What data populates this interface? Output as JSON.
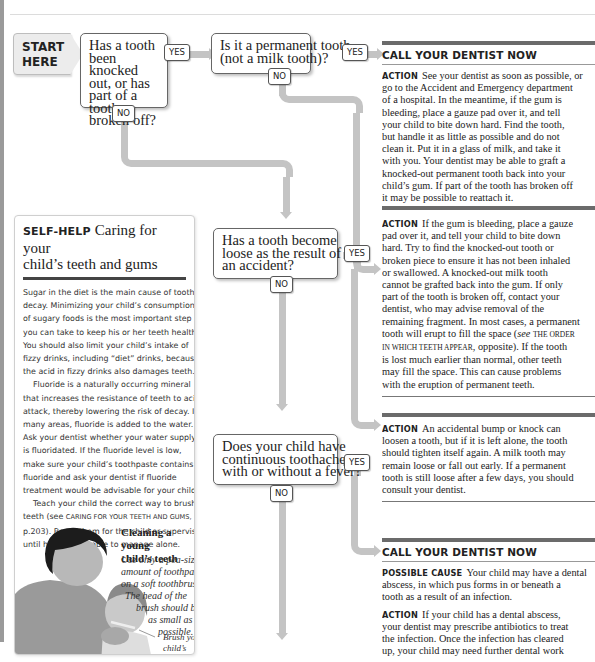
{
  "flowchart": {
    "start": {
      "line1": "START",
      "line2": "HERE"
    },
    "q1": {
      "lines": [
        "Has a tooth",
        "been knocked",
        "out, or has",
        "part of a tooth",
        "broken off?"
      ],
      "yes": "YES",
      "no": "NO"
    },
    "q2": {
      "lines": [
        "Is it a permanent tooth",
        "(not a milk tooth)?"
      ],
      "yes": "YES",
      "no": "NO"
    },
    "q3": {
      "lines": [
        "Has a tooth become",
        "loose as the result of",
        "an accident?"
      ],
      "yes": "YES",
      "no": "NO"
    },
    "q4": {
      "lines": [
        "Does your child have",
        "continuous toothache",
        "with or without a fever?"
      ],
      "yes": "YES",
      "no": "NO"
    }
  },
  "actions": {
    "a1": {
      "heading": "CALL YOUR DENTIST NOW",
      "label": "Action",
      "lines": [
        "See your dentist as soon as possible, or",
        "go to the Accident and Emergency department",
        "of a hospital. In the meantime, if the gum is",
        "bleeding, place a gauze pad over it, and tell",
        "your child to bite down hard. Find the tooth,",
        "but handle it as little as possible and do not",
        "clean it. Put it in a glass of milk, and take it",
        "with you. Your dentist may be able to graft a",
        "knocked-out permanent tooth back into your",
        "child’s gum. If part of the tooth has broken off",
        "it may be possible to reattach it."
      ]
    },
    "a2": {
      "label": "Action",
      "lines": [
        "If the gum is bleeding, place a gauze",
        "pad over it, and tell your child to bite down",
        "hard. Try to find the knocked-out tooth or",
        "broken piece to ensure it has not been inhaled",
        "or swallowed. A knocked-out milk tooth",
        "cannot be grafted back into the gum. If only",
        "part of the tooth is broken off, contact your",
        "dentist, who may advise removal of the",
        "remaining fragment. In most cases, a permanent",
        "tooth will erupt to fill the space (",
        "is lost much earlier than normal, other teeth",
        "may fill the space. This can cause problems",
        "with the eruption of permanent teeth."
      ],
      "see": "see",
      "ref_part1": "THE ORDER",
      "ref_part2": "IN WHICH TEETH APPEAR",
      "after_ref": ", opposite). If the tooth"
    },
    "a3": {
      "label": "Action",
      "lines": [
        "An accidental bump or knock can",
        "loosen a tooth, but if it is left alone, the tooth",
        "should tighten itself again. A milk tooth may",
        "remain loose or fall out early. If a permanent",
        "tooth is still loose after a few days, you should",
        "consult your dentist."
      ]
    },
    "a4": {
      "heading": "CALL YOUR DENTIST NOW",
      "cause_label": "Possible cause",
      "cause_lines": [
        "Your child may have a dental",
        "abscess, in which pus forms in or beneath a",
        "tooth as a result of an infection."
      ],
      "label": "Action",
      "lines": [
        "If your child has a dental abscess,",
        "your dentist may prescribe antibiotics to treat",
        "the infection. Once the infection has cleared",
        "up, your child may need further dental work"
      ]
    }
  },
  "selfhelp": {
    "label": "SELF-HELP",
    "title_line1": "Caring for your",
    "title_line2": "child’s teeth and gums",
    "body_lines": [
      "Sugar in the diet is the main cause of tooth",
      "decay. Minimizing your child’s consumption",
      "of sugary foods is the most important step",
      "you can take to keep his or her teeth healthy.",
      "You should also limit your child’s intake of",
      "fizzy drinks, including “diet” drinks, because",
      "the acid in fizzy drinks also damages teeth.",
      "Fluoride is a naturally occurring mineral",
      "that increases the resistance of teeth to acid",
      "attack, thereby lowering the risk of decay. In",
      "many areas, fluoride is added to the water.",
      "Ask your dentist whether your water supply",
      "is fluoridated. If the fluoride level is low,",
      "make sure your child’s toothpaste contains",
      "fluoride and ask your dentist if fluoride",
      "treatment would be advisable for your child.",
      "Teach your child the correct way to brush",
      "teeth (see ",
      "p.203). Brush them for the child or supervise",
      "until he or she is able to manage alone."
    ],
    "ref": "Caring for your teeth and gums,",
    "caption": {
      "title_line1": "Cleaning a young",
      "title_line2": "child’s teeth",
      "text_lines": [
        "Use only a pea-sized",
        "amount of toothpaste",
        "on a soft toothbrush.",
        "The head of the",
        "brush should be",
        "as small as",
        "possible."
      ],
      "callout_lines": [
        "Brush your",
        "child’s",
        "teeth from"
      ]
    }
  }
}
